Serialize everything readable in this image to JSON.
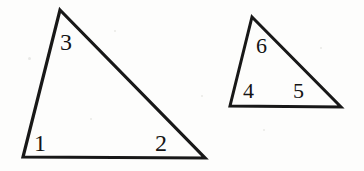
{
  "figure": {
    "background_color": "#fdfdfc",
    "stroke_color": "#181818",
    "label_color": "#141414",
    "width": 364,
    "height": 171
  },
  "shapes": [
    {
      "name": "left-triangle",
      "kind": "triangle",
      "stroke_width": 3.2,
      "points": "60,10 205,158 23,157",
      "vertices": [
        {
          "name": "apex",
          "x": 60,
          "y": 10
        },
        {
          "name": "bottom-right",
          "x": 205,
          "y": 158
        },
        {
          "name": "bottom-left",
          "x": 23,
          "y": 157
        }
      ]
    },
    {
      "name": "right-triangle",
      "kind": "triangle",
      "stroke_width": 3.0,
      "points": "252,17 341,107 230,106",
      "vertices": [
        {
          "name": "apex",
          "x": 252,
          "y": 17
        },
        {
          "name": "bottom-right",
          "x": 341,
          "y": 107
        },
        {
          "name": "bottom-left",
          "x": 230,
          "y": 106
        }
      ]
    }
  ],
  "labels": [
    {
      "name": "angle-label-1",
      "text": "1",
      "x": 34,
      "y": 151,
      "size": 24,
      "shape": "left-triangle",
      "vertex": "bottom-left"
    },
    {
      "name": "angle-label-2",
      "text": "2",
      "x": 155,
      "y": 151,
      "size": 24,
      "shape": "left-triangle",
      "vertex": "bottom-right"
    },
    {
      "name": "angle-label-3",
      "text": "3",
      "x": 60,
      "y": 50,
      "size": 24,
      "shape": "left-triangle",
      "vertex": "apex"
    },
    {
      "name": "angle-label-4",
      "text": "4",
      "x": 243,
      "y": 98,
      "size": 22,
      "shape": "right-triangle",
      "vertex": "bottom-left"
    },
    {
      "name": "angle-label-5",
      "text": "5",
      "x": 293,
      "y": 98,
      "size": 22,
      "shape": "right-triangle",
      "vertex": "bottom-right"
    },
    {
      "name": "angle-label-6",
      "text": "6",
      "x": 256,
      "y": 53,
      "size": 22,
      "shape": "right-triangle",
      "vertex": "apex"
    }
  ],
  "specks": [
    {
      "x": 28,
      "y": 57,
      "size": 3
    },
    {
      "x": 114,
      "y": 30,
      "size": 2
    },
    {
      "x": 263,
      "y": 129,
      "size": 2
    },
    {
      "x": 90,
      "y": 118,
      "size": 2
    },
    {
      "x": 320,
      "y": 47,
      "size": 2
    },
    {
      "x": 201,
      "y": 95,
      "size": 2
    }
  ]
}
